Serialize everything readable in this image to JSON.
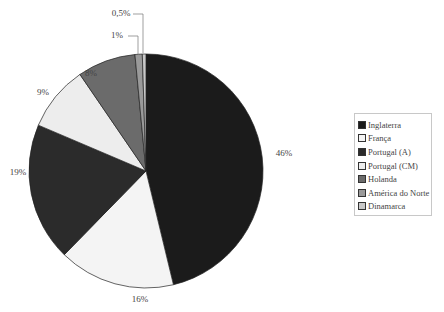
{
  "chart_data": {
    "type": "pie",
    "title": "",
    "categories": [
      "Inglaterra",
      "França",
      "Portugal (A)",
      "Portugal (CM)",
      "Holanda",
      "América do Norte",
      "Dinamarca"
    ],
    "values": [
      46,
      16,
      19,
      9,
      8,
      1,
      0.5
    ],
    "labels": [
      "46%",
      "16%",
      "19%",
      "9%",
      "8%",
      "1%",
      "0,5%"
    ],
    "colors": [
      "#1b1b1b",
      "#f4f4f4",
      "#2b2b2b",
      "#ededed",
      "#6b6b6b",
      "#9a9a9a",
      "#c9c9c9"
    ],
    "start_angle_deg": 0,
    "direction": "clockwise",
    "legend_position": "right"
  },
  "legend": {
    "items": [
      {
        "label": "Inglaterra"
      },
      {
        "label": "França"
      },
      {
        "label": "Portugal (A)"
      },
      {
        "label": "Portugal (CM)"
      },
      {
        "label": "Holanda"
      },
      {
        "label": "América do Norte"
      },
      {
        "label": "Dinamarca"
      }
    ]
  }
}
